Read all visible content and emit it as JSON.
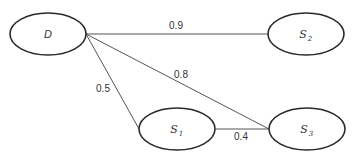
{
  "diagram": {
    "type": "weighted-graph",
    "nodes": [
      {
        "id": "D",
        "label": "D",
        "subscript": "",
        "cx": 48,
        "cy": 34,
        "rx": 38,
        "ry": 21
      },
      {
        "id": "S2",
        "label": "S",
        "subscript": "2",
        "cx": 306,
        "cy": 34,
        "rx": 38,
        "ry": 21
      },
      {
        "id": "S1",
        "label": "S",
        "subscript": "1",
        "cx": 177,
        "cy": 129,
        "rx": 38,
        "ry": 21
      },
      {
        "id": "S3",
        "label": "S",
        "subscript": "3",
        "cx": 307,
        "cy": 129,
        "rx": 38,
        "ry": 21
      }
    ],
    "edges": [
      {
        "from": "D",
        "to": "S2",
        "weight": "0.9"
      },
      {
        "from": "D",
        "to": "S3",
        "weight": "0.8"
      },
      {
        "from": "D",
        "to": "S1",
        "weight": "0.5"
      },
      {
        "from": "S1",
        "to": "S3",
        "weight": "0.4"
      }
    ]
  }
}
